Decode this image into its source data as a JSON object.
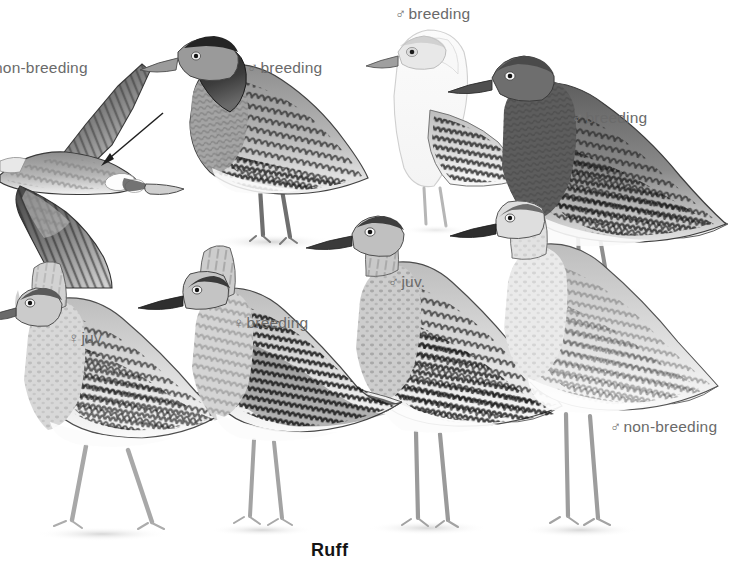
{
  "plate": {
    "species_name": "Ruff",
    "background_color": "#ffffff",
    "label_color": "#6a6a6a",
    "ink_color": "#3a3a3a",
    "width": 749,
    "height": 576
  },
  "labels": [
    {
      "id": "flight-non-breeding",
      "text": "non-breeding",
      "symbol": "",
      "x": 0,
      "y": 60,
      "clipped_left": true
    },
    {
      "id": "male-breeding-dark",
      "text": "breeding",
      "symbol": "♂",
      "x": 247,
      "y": 60
    },
    {
      "id": "male-breeding-white",
      "text": "breeding",
      "symbol": "♂",
      "x": 395,
      "y": 6
    },
    {
      "id": "male-breeding-rufous",
      "text": "breeding",
      "symbol": "♂",
      "x": 572,
      "y": 110
    },
    {
      "id": "male-juvenile",
      "text": "juv.",
      "symbol": "♂",
      "x": 388,
      "y": 274
    },
    {
      "id": "female-juvenile",
      "text": "juv.",
      "symbol": "♀",
      "x": 68,
      "y": 330
    },
    {
      "id": "female-breeding",
      "text": "breeding",
      "symbol": "♀",
      "x": 233,
      "y": 315
    },
    {
      "id": "male-non-breeding",
      "text": "non-breeding",
      "symbol": "♂",
      "x": 610,
      "y": 419
    }
  ],
  "species_name_position": {
    "x": 311,
    "y": 540
  },
  "pointer_arrow": {
    "id": "rump-patch-arrow",
    "from_x": 163,
    "from_y": 113,
    "to_x": 102,
    "to_y": 164,
    "points_to": "white-oval-rump-patches"
  },
  "figures": [
    {
      "id": "flying-bird-dorsal",
      "name": "ruff-in-flight-dorsal-view",
      "plumage": "non-breeding",
      "sex": "unspecified",
      "pose": "flight",
      "tone": "dark-grey"
    },
    {
      "id": "male-breeding-dark-standing",
      "name": "male-ruff-breeding-dark-collar",
      "plumage": "breeding",
      "sex": "male",
      "pose": "standing-in-water",
      "tone": "dark-grey-ruff"
    },
    {
      "id": "male-breeding-white-standing",
      "name": "male-ruff-breeding-white-morph",
      "plumage": "breeding",
      "sex": "male",
      "pose": "standing",
      "tone": "white-pale"
    },
    {
      "id": "male-breeding-rufous-standing",
      "name": "male-ruff-breeding-rufous-morph",
      "plumage": "breeding",
      "sex": "male",
      "pose": "standing-in-water",
      "tone": "mid-dark-grey"
    },
    {
      "id": "male-juvenile-standing",
      "name": "male-ruff-juvenile",
      "plumage": "juvenile",
      "sex": "male",
      "pose": "standing",
      "tone": "scalloped-dark"
    },
    {
      "id": "female-juvenile-standing",
      "name": "female-ruff-juvenile",
      "plumage": "juvenile",
      "sex": "female",
      "pose": "walking",
      "tone": "pale-buff"
    },
    {
      "id": "female-breeding-standing",
      "name": "female-ruff-breeding",
      "plumage": "breeding",
      "sex": "female",
      "pose": "standing",
      "tone": "heavily-barred"
    },
    {
      "id": "male-non-breeding-standing",
      "name": "male-ruff-non-breeding",
      "plumage": "non-breeding",
      "sex": "male",
      "pose": "standing",
      "tone": "plain-pale-grey"
    }
  ]
}
